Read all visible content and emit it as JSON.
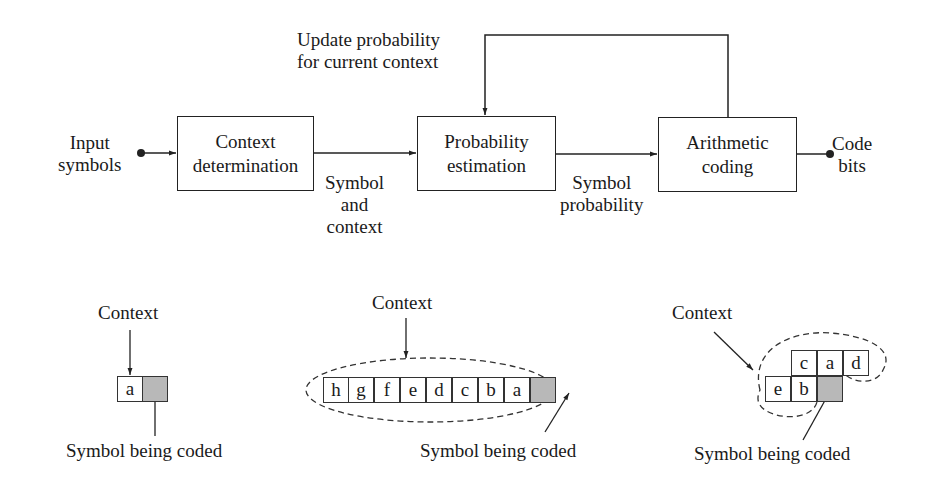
{
  "top_diagram": {
    "input_label": [
      "Input",
      "symbols"
    ],
    "output_label": [
      "Code",
      "bits"
    ],
    "feedback_label": [
      "Update probability",
      "for current context"
    ],
    "blocks": [
      {
        "id": "context-determination",
        "lines": [
          "Context",
          "determination"
        ]
      },
      {
        "id": "probability-estimation",
        "lines": [
          "Probability",
          "estimation"
        ]
      },
      {
        "id": "arithmetic-coding",
        "lines": [
          "Arithmetic",
          "coding"
        ]
      }
    ],
    "edge_labels": {
      "symbol_and_context": [
        "Symbol",
        "and",
        "context"
      ],
      "symbol_probability": [
        "Symbol",
        "probability"
      ]
    }
  },
  "bottom_examples": [
    {
      "context_label": "Context",
      "coded_label": "Symbol being coded",
      "cells": [
        "a",
        ""
      ]
    },
    {
      "context_label": "Context",
      "coded_label": "Symbol being coded",
      "cells": [
        "h",
        "g",
        "f",
        "e",
        "d",
        "c",
        "b",
        "a",
        ""
      ]
    },
    {
      "context_label": "Context",
      "coded_label": "Symbol being coded",
      "top_row": [
        "c",
        "a",
        "d"
      ],
      "bottom_row": [
        "e",
        "b",
        ""
      ]
    }
  ],
  "colors": {
    "line": "#222222",
    "shaded_cell": "#b8b8b8"
  }
}
